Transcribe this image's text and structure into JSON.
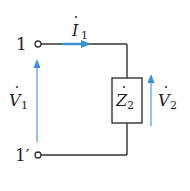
{
  "diagram": {
    "type": "circuit",
    "colors": {
      "wire": "#333333",
      "arrow": "#3a8fd9",
      "text": "#222222",
      "background": "#ffffff"
    },
    "terminals": {
      "top": {
        "label": "1"
      },
      "bottom": {
        "label": "1′",
        "label_main": "1",
        "label_prime": "′"
      }
    },
    "current": {
      "symbol": "I",
      "subscript": "1",
      "dot": "·"
    },
    "input_voltage": {
      "symbol": "V",
      "subscript": "1",
      "dot": "·"
    },
    "impedance": {
      "symbol": "Z",
      "subscript": "2",
      "dot": "·"
    },
    "output_voltage": {
      "symbol": "V",
      "subscript": "2",
      "dot": "·"
    }
  }
}
